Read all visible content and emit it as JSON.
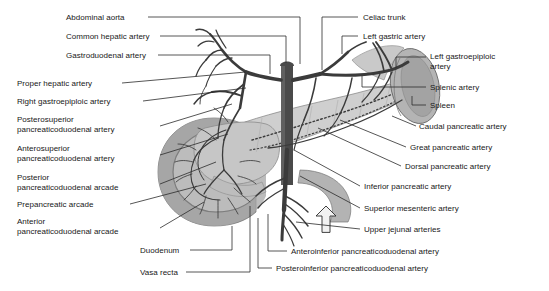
{
  "figure": {
    "type": "anatomical-diagram",
    "background_color": "#ffffff",
    "palette": {
      "artery_dark": "#3a3a3a",
      "aorta": "#4a4a4a",
      "duodenum": "#a9a9a9",
      "pancreas": "#cccccc",
      "pancreas_edge": "#8f8f8f",
      "spleen": "#b0b0b0",
      "spleen_inner": "#9a9a9a",
      "stomach": "#bdbdbd",
      "leader_line": "#2b2b2b",
      "text": "#181818"
    }
  },
  "labels_left": [
    {
      "id": "abdominal-aorta",
      "text": "Abdominal aorta",
      "x": 66,
      "y": 13
    },
    {
      "id": "common-hepatic-artery",
      "text": "Common hepatic artery",
      "x": 66,
      "y": 32
    },
    {
      "id": "gastroduodenal-artery",
      "text": "Gastroduodenal artery",
      "x": 66,
      "y": 51
    },
    {
      "id": "proper-hepatic-artery",
      "text": "Proper hepatic artery",
      "x": 17,
      "y": 79
    },
    {
      "id": "right-gastroepiploic-artery",
      "text": "Right gastroepiploic artery",
      "x": 17,
      "y": 98
    },
    {
      "id": "posterosuperior-pd-artery",
      "text": "Posterosuperior\npancreaticoduodenal artery",
      "x": 17,
      "y": 113
    },
    {
      "id": "anterosuperior-pd-artery",
      "text": "Anterosuperior\npancreaticoduodenal artery",
      "x": 17,
      "y": 142
    },
    {
      "id": "posterior-pd-arcade",
      "text": "Posterior\npancreaticoduodenal arcade",
      "x": 17,
      "y": 171
    },
    {
      "id": "prepancreatic-arcade",
      "text": "Prepancreatic arcade",
      "x": 17,
      "y": 200
    },
    {
      "id": "anterior-pd-arcade",
      "text": "Anterior\npancreaticoduodenal arcade",
      "x": 17,
      "y": 215
    },
    {
      "id": "duodenum",
      "text": "Duodenum",
      "x": 140,
      "y": 246
    },
    {
      "id": "vasa-recta",
      "text": "Vasa recta",
      "x": 140,
      "y": 268
    }
  ],
  "labels_right": [
    {
      "id": "celiac-trunk",
      "text": "Celiac trunk",
      "x": 363,
      "y": 13
    },
    {
      "id": "left-gastric-artery",
      "text": "Left gastric artery",
      "x": 363,
      "y": 32
    },
    {
      "id": "left-gastroepiploic-artery",
      "text": "Left gastroepiploic\nartery",
      "x": 430,
      "y": 52
    },
    {
      "id": "splenic-artery",
      "text": "Splenic artery",
      "x": 430,
      "y": 83
    },
    {
      "id": "spleen",
      "text": "Spleen",
      "x": 430,
      "y": 101
    },
    {
      "id": "caudal-pancreatic-artery",
      "text": "Caudal pancreatic artery",
      "x": 419,
      "y": 123
    },
    {
      "id": "great-pancreatic-artery",
      "text": "Great pancreatic artery",
      "x": 410,
      "y": 143
    },
    {
      "id": "dorsal-pancreatic-artery",
      "text": "Dorsal pancreatic artery",
      "x": 405,
      "y": 163
    },
    {
      "id": "inferior-pancreatic-artery",
      "text": "Inferior pancreatic artery",
      "x": 364,
      "y": 182
    },
    {
      "id": "superior-mesenteric-artery",
      "text": "Superior mesenteric artery",
      "x": 364,
      "y": 204
    },
    {
      "id": "upper-jejunal-arteries",
      "text": "Upper jejunal arteries",
      "x": 364,
      "y": 225
    },
    {
      "id": "anteroinferior-pd-artery",
      "text": "Anteroinferior pancreaticoduodenal artery",
      "x": 291,
      "y": 247
    },
    {
      "id": "posteroinferior-pd-artery",
      "text": "Posteroinferior pancreaticoduodenal artery",
      "x": 276,
      "y": 264
    }
  ]
}
